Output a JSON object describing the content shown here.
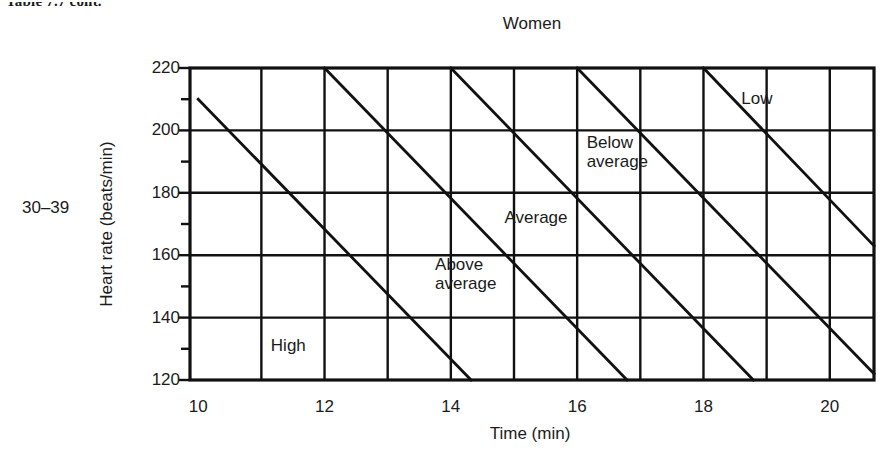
{
  "running_head": "Table 7.7  cont.",
  "age_group": "30–39",
  "chart_data": {
    "type": "line",
    "title": "Women",
    "xlabel": "Time (min)",
    "ylabel": "Heart rate (beats/min)",
    "xlim": [
      9.87,
      20.7
    ],
    "ylim": [
      120,
      220
    ],
    "xticks": [
      10,
      12,
      14,
      16,
      18,
      20
    ],
    "xtick_labels": [
      "10",
      "12",
      "14",
      "16",
      "18",
      "20"
    ],
    "x_minor_ticks": [
      11,
      13,
      15,
      17,
      19
    ],
    "yticks": [
      120,
      140,
      160,
      180,
      200,
      220
    ],
    "ytick_labels": [
      "120",
      "140",
      "160",
      "180",
      "200",
      "220"
    ],
    "y_minor_ticks": [
      130,
      150,
      170,
      190,
      210
    ],
    "grid": "major x and y gridlines shown across plot area",
    "legend": "none — zones labelled in place",
    "series": [
      {
        "name": "High / Above average boundary",
        "x": [
          10.0,
          14.32
        ],
        "y": [
          210,
          120
        ]
      },
      {
        "name": "Above average / Average boundary",
        "x": [
          12.0,
          16.79
        ],
        "y": [
          220,
          120
        ]
      },
      {
        "name": "Average / Below average boundary",
        "x": [
          14.0,
          18.79
        ],
        "y": [
          220,
          120
        ]
      },
      {
        "name": "Below average / Low boundary",
        "x": [
          16.0,
          20.7
        ],
        "y": [
          220,
          122
        ]
      },
      {
        "name": "Low lower boundary",
        "x": [
          18.0,
          20.7
        ],
        "y": [
          220,
          163
        ]
      }
    ],
    "zone_labels": [
      {
        "text": "High",
        "x": 11.15,
        "y": 131
      },
      {
        "text": "Above\naverage",
        "x": 13.75,
        "y": 157
      },
      {
        "text": "Average",
        "x": 14.85,
        "y": 172
      },
      {
        "text": "Below\naverage",
        "x": 16.15,
        "y": 196
      },
      {
        "text": "Low",
        "x": 18.6,
        "y": 210
      }
    ],
    "annotations": "Five parallel diagonal boundary lines divide the chart into five fitness zones: High, Above average, Average, Below average, Low.",
    "axis_color": "#111111",
    "line_color": "#111111"
  }
}
